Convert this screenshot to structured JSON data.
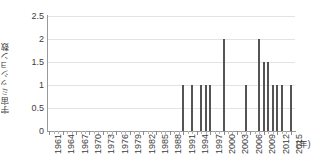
{
  "chart_data": {
    "type": "bar",
    "title": "",
    "xlabel": "(年)",
    "ylabel": "宇宙ミッション数",
    "ylim": [
      0,
      2.5
    ],
    "ytick_values": [
      0,
      0.5,
      1,
      1.5,
      2,
      2.5
    ],
    "ytick_labels": [
      "0",
      "0.5",
      "1",
      "1.5",
      "2",
      "2.5"
    ],
    "xlim": [
      1960.5,
      2016.0
    ],
    "grid": true,
    "legend": null,
    "bar_color": "#545454",
    "grid_color": "#e3e3e3",
    "axis_color": "#9a9a9a",
    "xtick_step": 3,
    "xtick_labels": [
      "1961",
      "1964",
      "1967",
      "1970",
      "1973",
      "1976",
      "1979",
      "1982",
      "1985",
      "1988",
      "1991",
      "1994",
      "1997",
      "2000",
      "2003",
      "2006",
      "2009",
      "2012",
      "2015"
    ],
    "categories": [
      1961,
      1962,
      1963,
      1964,
      1965,
      1966,
      1967,
      1968,
      1969,
      1970,
      1971,
      1972,
      1973,
      1974,
      1975,
      1976,
      1977,
      1978,
      1979,
      1980,
      1981,
      1982,
      1983,
      1984,
      1985,
      1986,
      1987,
      1988,
      1989,
      1990,
      1991,
      1992,
      1993,
      1994,
      1995,
      1996,
      1997,
      1998,
      1999,
      2000,
      2001,
      2002,
      2003,
      2004,
      2005,
      2006,
      2007,
      2008,
      2009,
      2010,
      2011,
      2012,
      2013,
      2014,
      2015
    ],
    "values": [
      0,
      0,
      0,
      0,
      0,
      0,
      0,
      0,
      0,
      0,
      0,
      0,
      0,
      0,
      0,
      0,
      0,
      0,
      0,
      0,
      0,
      0,
      0,
      0,
      0,
      0,
      0,
      0,
      0,
      0,
      1,
      0,
      1,
      0,
      1,
      1,
      1,
      0,
      0,
      2,
      0,
      0,
      0,
      0,
      1,
      0,
      0,
      2,
      1.5,
      1.5,
      1,
      1,
      1,
      0,
      1
    ]
  }
}
